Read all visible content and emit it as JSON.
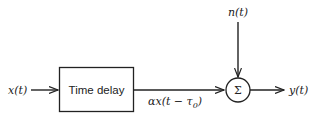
{
  "diagram": {
    "type": "block-diagram",
    "nodes": [
      {
        "id": "input",
        "label": "x(t)",
        "role": "input"
      },
      {
        "id": "delay",
        "label": "Time delay",
        "role": "block"
      },
      {
        "id": "sum",
        "label": "Σ",
        "role": "summing-junction"
      },
      {
        "id": "noise",
        "label": "n(t)",
        "role": "input"
      },
      {
        "id": "output",
        "label": "y(t)",
        "role": "output"
      }
    ],
    "edges": [
      {
        "from": "input",
        "to": "delay",
        "label": ""
      },
      {
        "from": "delay",
        "to": "sum",
        "label": "αx(t − τ0)"
      },
      {
        "from": "noise",
        "to": "sum",
        "label": ""
      },
      {
        "from": "sum",
        "to": "output",
        "label": ""
      }
    ]
  },
  "labels": {
    "input": "x(t)",
    "block": "Time delay",
    "noise": "n(t)",
    "sum": "Σ",
    "output": "y(t)",
    "delayed_main": "αx(t − τ",
    "delayed_sub": "0",
    "delayed_close": ")"
  }
}
